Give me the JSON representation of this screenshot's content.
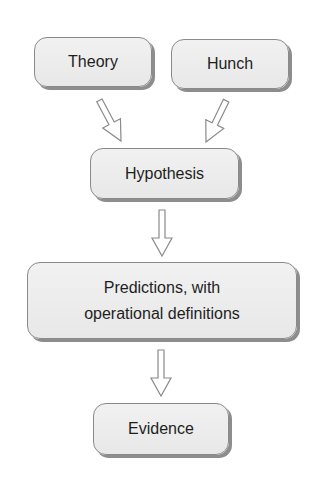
{
  "diagram": {
    "type": "flowchart",
    "nodes": [
      {
        "id": "theory",
        "label": "Theory"
      },
      {
        "id": "hunch",
        "label": "Hunch"
      },
      {
        "id": "hypothesis",
        "label": "Hypothesis"
      },
      {
        "id": "predictions",
        "label_line1": "Predictions, with",
        "label_line2": "operational definitions"
      },
      {
        "id": "evidence",
        "label": "Evidence"
      }
    ],
    "edges": [
      {
        "from": "theory",
        "to": "hypothesis"
      },
      {
        "from": "hunch",
        "to": "hypothesis"
      },
      {
        "from": "hypothesis",
        "to": "predictions"
      },
      {
        "from": "predictions",
        "to": "evidence"
      }
    ],
    "colors": {
      "box_fill": "#ebebeb",
      "box_border": "#8a8a8a",
      "box_shadow": "#8d8d8d",
      "arrow_stroke": "#8a8a8a",
      "arrow_fill": "#ffffff",
      "text": "#1e1e1e"
    }
  }
}
